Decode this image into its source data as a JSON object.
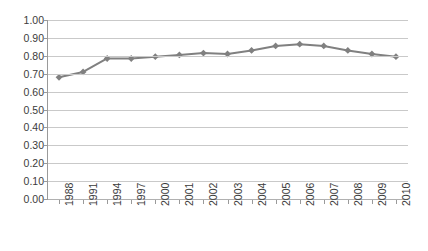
{
  "chart_data": {
    "type": "line",
    "title": "",
    "subtitle": "",
    "xlabel": "",
    "ylabel": "",
    "categories": [
      "1988",
      "1991",
      "1994",
      "1997",
      "2000",
      "2001",
      "2002",
      "2003",
      "2004",
      "2005",
      "2006",
      "2007",
      "2008",
      "2009",
      "2010"
    ],
    "values": [
      0.68,
      0.71,
      0.785,
      0.785,
      0.795,
      0.805,
      0.815,
      0.81,
      0.83,
      0.855,
      0.865,
      0.855,
      0.83,
      0.81,
      0.795
    ],
    "series": [
      {
        "name": "",
        "values": [
          0.68,
          0.71,
          0.785,
          0.785,
          0.795,
          0.805,
          0.815,
          0.81,
          0.83,
          0.855,
          0.865,
          0.855,
          0.83,
          0.81,
          0.795
        ]
      }
    ],
    "ylim": [
      0.0,
      1.0
    ],
    "ytick_step": 0.1,
    "ytick_labels": [
      "1.00",
      "0.90",
      "0.80",
      "0.70",
      "0.60",
      "0.50",
      "0.40",
      "0.30",
      "0.20",
      "0.10",
      "0.00"
    ],
    "ytick_values": [
      1.0,
      0.9,
      0.8,
      0.7,
      0.6,
      0.5,
      0.4,
      0.3,
      0.2,
      0.1,
      0.0
    ],
    "grid": true,
    "grid_axis": "y",
    "legend": false,
    "legend_position": "none",
    "marker": "diamond",
    "xtick_label_rotation": -90,
    "colors": {
      "line": "#808080",
      "marker": "#808080",
      "grid": "#c9c9c9",
      "axis": "#9a9a9a",
      "text": "#3b3b3b",
      "background": "#ffffff"
    }
  }
}
